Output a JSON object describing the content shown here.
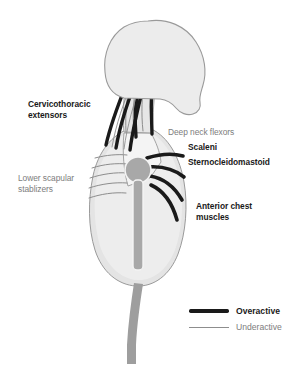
{
  "diagram": {
    "background_color": "#ffffff",
    "view": "lateral profile of head, neck and torso facing right"
  },
  "colors": {
    "overactive_line": "#1a1a1a",
    "underactive_line": "#8d8d8d",
    "skull_fill": "#ececec",
    "skull_outline": "#9a9a9a",
    "torso_fill": "#e4e4e4",
    "torso_outline": "#9a9a9a",
    "ribcage_fill": "#efefef",
    "shoulder_joint_fill": "#a8a8a8",
    "sternum_fill": "#a8a8a8",
    "limb_fill": "#9e9e9e",
    "overactive_text": "#1a1a1a",
    "underactive_text": "#7d7d7d",
    "background": "#ffffff"
  },
  "labels": [
    {
      "id": "cervicothoracic-extensors",
      "text": "Cervicothoracic\nextensors",
      "state": "Overactive",
      "side": "left",
      "x": 28,
      "y": 99
    },
    {
      "id": "lower-scapular-stablizers",
      "text": "Lower scapular\nstablizers",
      "state": "Underactive",
      "side": "left",
      "x": 18,
      "y": 173
    },
    {
      "id": "deep-neck-flexors",
      "text": "Deep neck flexors",
      "state": "Underactive",
      "side": "right",
      "x": 168,
      "y": 127
    },
    {
      "id": "scaleni",
      "text": "Scaleni",
      "state": "Overactive",
      "side": "right",
      "x": 188,
      "y": 142
    },
    {
      "id": "sternocleidomastoid",
      "text": "Sternocleidomastoid",
      "state": "Overactive",
      "side": "right",
      "x": 188,
      "y": 157
    },
    {
      "id": "anterior-chest-muscles",
      "text": "Anterior chest\nmuscles",
      "state": "Overactive",
      "side": "right",
      "x": 196,
      "y": 201
    }
  ],
  "legend": {
    "items": [
      {
        "id": "overactive",
        "label": "Overactive",
        "style": "thick-dark-line"
      },
      {
        "id": "underactive",
        "label": "Underactive",
        "style": "thin-gray-line"
      }
    ]
  },
  "anatomy": {
    "parts": [
      "skull",
      "cervical-spine",
      "torso",
      "ribcage",
      "sternum",
      "shoulder-joint",
      "upper-limb"
    ],
    "overactive_muscle_groups": [
      "cervicothoracic extensors (posterior neck, 3 thick lines)",
      "scaleni",
      "sternocleidomastoid",
      "anterior chest muscles (4 thick fanning lines)"
    ],
    "underactive_muscle_groups": [
      "deep neck flexors",
      "lower scapular stablizers (5 thin rib lines)"
    ]
  }
}
